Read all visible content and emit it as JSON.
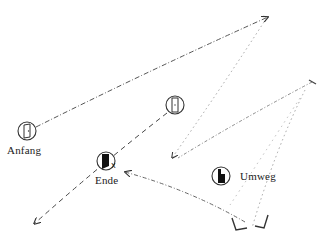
{
  "diagram": {
    "nodes": [
      {
        "id": "anfang",
        "label": "Anfang",
        "icon": "open-door-icon",
        "cx": 27,
        "cy": 131,
        "r": 9,
        "label_x": 7,
        "label_y": 144
      },
      {
        "id": "door-closed",
        "label": "",
        "icon": "closed-door-icon",
        "cx": 175,
        "cy": 105,
        "r": 9
      },
      {
        "id": "ende",
        "label": "Ende",
        "icon": "dark-door-icon",
        "cx": 106,
        "cy": 161,
        "r": 9,
        "label_x": 94,
        "label_y": 174,
        "marker": "x"
      },
      {
        "id": "umweg",
        "label": "Umweg",
        "icon": "dark-door-icon",
        "cx": 221,
        "cy": 176,
        "r": 9,
        "label_x": 240,
        "label_y": 170
      }
    ],
    "edges": [
      {
        "from": "anfang",
        "to": "top-right",
        "style": "dash-dot"
      },
      {
        "from": "top-right",
        "to": "left-mid",
        "style": "dotted"
      },
      {
        "from": "door-closed",
        "to": "bottom-left",
        "style": "dashed"
      },
      {
        "from": "right-top",
        "to": "left-mid",
        "style": "dotted"
      },
      {
        "from": "right-mid",
        "to": "bottom-right-1",
        "style": "dotted"
      },
      {
        "from": "bottom-right-2",
        "to": "ende",
        "style": "dash-dot"
      },
      {
        "from": "ende-area",
        "to": "bottom-right-2",
        "style": "dotted"
      }
    ],
    "colors": {
      "stroke": "#333333",
      "light_stroke": "#888888",
      "fill_dark": "#111111"
    }
  }
}
